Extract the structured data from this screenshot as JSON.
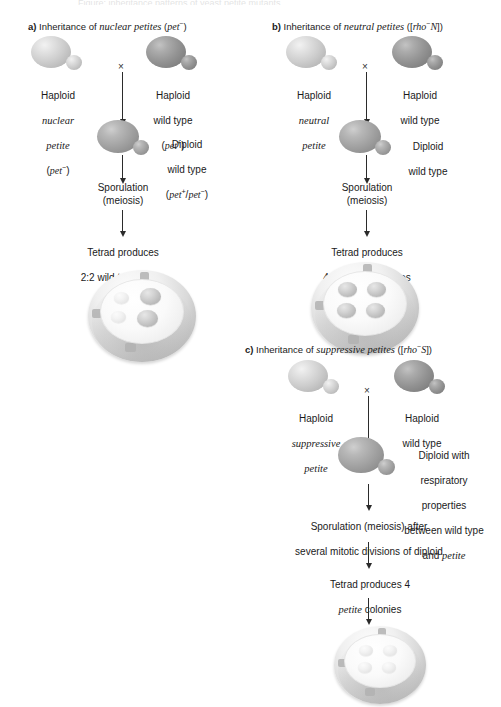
{
  "figure": {
    "cropped_caption_fragment": "Figure: inheritance patterns of yeast petite mutants",
    "cross_symbol": "×"
  },
  "panels": [
    {
      "id": "a",
      "label": "a)",
      "title_prefix": "Inheritance of ",
      "title_italic": "nuclear petites",
      "title_suffix_open": " (",
      "title_gene": "pet",
      "title_gene_sup": "−",
      "title_suffix_close": ")",
      "parent_left": {
        "line1": "Haploid",
        "line2_italic": "nuclear",
        "line3_italic": "petite",
        "line4_gene": "pet",
        "line4_sup": "−",
        "type": "light"
      },
      "parent_right": {
        "line1": "Haploid",
        "line2": "wild type",
        "line3_gene": "pet",
        "line3_sup": "+",
        "type": "dark"
      },
      "diploid": {
        "line1": "Diploid",
        "line2": "wild type",
        "genotype_a": "pet",
        "genotype_a_sup": "+",
        "genotype_sep": "/",
        "genotype_b": "pet",
        "genotype_b_sup": "−",
        "type": "mid"
      },
      "step_sporulation": "Sporulation\n(meiosis)",
      "step_result_line1": "Tetrad produces",
      "step_result_line2_pre": "2:2 wild type: ",
      "step_result_line2_italic": "petite",
      "step_result_line3": "colonies",
      "dish": {
        "colonies": [
          {
            "kind": "small",
            "note": "petite colony"
          },
          {
            "kind": "small",
            "note": "petite colony"
          },
          {
            "kind": "big",
            "note": "wild-type colony"
          },
          {
            "kind": "big",
            "note": "wild-type colony"
          }
        ],
        "count": 4
      }
    },
    {
      "id": "b",
      "label": "b)",
      "title_prefix": "Inheritance of ",
      "title_italic": "neutral petites",
      "title_suffix_open": " ([",
      "title_gene": "rho",
      "title_gene_sup": "−",
      "title_gene_tail": "N",
      "title_suffix_close": "])",
      "parent_left": {
        "line1": "Haploid",
        "line2_italic": "neutral",
        "line3_italic": "petite",
        "type": "light"
      },
      "parent_right": {
        "line1": "Haploid",
        "line2": "wild type",
        "type": "dark"
      },
      "diploid": {
        "line1": "Diploid",
        "line2": "wild type",
        "type": "mid"
      },
      "step_sporulation": "Sporulation\n(meiosis)",
      "step_result_line1": "Tetrad produces",
      "step_result_line2": "4 wild-type colonies",
      "dish": {
        "colonies": [
          {
            "kind": "big",
            "note": "wild-type colony"
          },
          {
            "kind": "big",
            "note": "wild-type colony"
          },
          {
            "kind": "big",
            "note": "wild-type colony"
          },
          {
            "kind": "big",
            "note": "wild-type colony"
          }
        ],
        "count": 4
      }
    },
    {
      "id": "c",
      "label": "c)",
      "title_prefix": "Inheritance of ",
      "title_italic": "suppressive petites",
      "title_suffix_open": " ([",
      "title_gene": "rho",
      "title_gene_sup": "−",
      "title_gene_tail": "S",
      "title_suffix_close": "])",
      "parent_left": {
        "line1": "Haploid",
        "line2_italic": "suppressive",
        "line3_italic": "petite",
        "type": "light"
      },
      "parent_right": {
        "line1": "Haploid",
        "line2": "wild type",
        "type": "dark"
      },
      "diploid": {
        "line1": "Diploid with",
        "line2": "respiratory",
        "line3": "properties",
        "line4": "between wild type",
        "line5_pre": "and ",
        "line5_italic": "petite",
        "type": "mid"
      },
      "step_sporulation_line1": "Sporulation (meiosis) after",
      "step_sporulation_line2": "several mitotic divisions of diploid",
      "step_result_line1": "Tetrad produces 4",
      "step_result_line2_italic": "petite",
      "step_result_line2_post": " colonies",
      "dish": {
        "colonies": [
          {
            "kind": "small",
            "note": "petite colony"
          },
          {
            "kind": "small",
            "note": "petite colony"
          },
          {
            "kind": "small",
            "note": "petite colony"
          },
          {
            "kind": "small",
            "note": "petite colony"
          }
        ],
        "count": 4
      }
    }
  ],
  "colors": {
    "petite_cell": "#cdcdcd",
    "wildtype_cell": "#939393",
    "diploid_cell": "#a2a2a2",
    "arrow": "#2b2b2b",
    "text": "#1a1a1a",
    "dish_rim": "#d9d9d9",
    "colony_big": "#bdbdbd",
    "colony_small": "#e7e7e7"
  }
}
